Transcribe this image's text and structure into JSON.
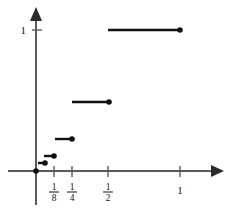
{
  "figure": {
    "background_color": "#ffffff",
    "axis_color": "#5a5a5a",
    "curve_color": "#111111"
  },
  "labels": {
    "y_one": "1",
    "x_one": "1",
    "frac_eighth_num": "1",
    "frac_eighth_den": "8",
    "frac_quarter_num": "1",
    "frac_quarter_den": "4",
    "frac_half_num": "1",
    "frac_half_den": "2"
  },
  "chart_data": {
    "type": "line",
    "title": "",
    "xlabel": "",
    "ylabel": "",
    "xlim": [
      0,
      1.22
    ],
    "ylim": [
      0,
      1.12
    ],
    "grid": false,
    "legend_position": "none",
    "x_ticks": [
      0.125,
      0.25,
      0.5,
      1
    ],
    "x_tick_labels": [
      "1/8",
      "1/4",
      "1/2",
      "1"
    ],
    "y_ticks": [
      1
    ],
    "y_tick_labels": [
      "1"
    ],
    "steps": [
      {
        "x_start": 0.0,
        "x_end": 0.0,
        "y": 0.0,
        "right_closed": true,
        "label": "origin point (0,0)"
      },
      {
        "x_start": 0.03125,
        "x_end": 0.0625,
        "y": 0.06,
        "right_closed": true,
        "label": "step at 1/16"
      },
      {
        "x_start": 0.0625,
        "x_end": 0.125,
        "y": 0.13,
        "right_closed": true,
        "label": "step at 1/8"
      },
      {
        "x_start": 0.125,
        "x_end": 0.25,
        "y": 0.25,
        "right_closed": true,
        "label": "step at 1/4"
      },
      {
        "x_start": 0.25,
        "x_end": 0.5,
        "y": 0.5,
        "right_closed": true,
        "label": "step at 1/2"
      },
      {
        "x_start": 0.5,
        "x_end": 1.0,
        "y": 1.0,
        "right_closed": true,
        "label": "step at 1"
      }
    ],
    "series": [
      {
        "name": "step function",
        "x": [
          0.0,
          0.0625,
          0.125,
          0.25,
          0.5,
          1.0
        ],
        "values": [
          0.0,
          0.06,
          0.13,
          0.25,
          0.5,
          1.0
        ]
      }
    ]
  },
  "geometry": {
    "origin_px": {
      "x": 36,
      "y": 171
    },
    "x_tick_px": [
      54,
      72,
      108,
      180
    ],
    "y_one_px": 30,
    "segments_px": [
      {
        "x1": 36,
        "x2": 36,
        "y": 171,
        "dot_x": 36
      },
      {
        "x1": 38,
        "x2": 45,
        "y": 163,
        "dot_x": 45
      },
      {
        "x1": 44,
        "x2": 54,
        "y": 156,
        "dot_x": 54
      },
      {
        "x1": 55,
        "x2": 72,
        "y": 139,
        "dot_x": 72
      },
      {
        "x1": 72,
        "x2": 109,
        "y": 102,
        "dot_x": 109
      },
      {
        "x1": 108,
        "x2": 180,
        "y": 30,
        "dot_x": 180
      }
    ]
  }
}
